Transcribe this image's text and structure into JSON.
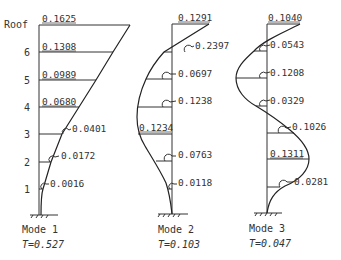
{
  "story_labels": [
    "Roof",
    "6",
    "5",
    "4",
    "3",
    "2",
    "1"
  ],
  "modes": [
    {
      "name": "Mode 1",
      "period_label": "T=0.527",
      "values": [
        "0.1625",
        "0.1308",
        "0.0989",
        "0.0680",
        "0.0401",
        "0.0172",
        "0.0016"
      ]
    },
    {
      "name": "Mode 2",
      "period_label": "T=0.103",
      "values": [
        "0.1291",
        "0.2397",
        "0.0697",
        "0.1238",
        "0.1234",
        "0.0763",
        "0.0118"
      ]
    },
    {
      "name": "Mode 3",
      "period_label": "T=0.047",
      "values": [
        "0.1040",
        "0.0543",
        "0.1208",
        "0.0329",
        "0.1026",
        "0.1311",
        "0.0281"
      ]
    }
  ]
}
